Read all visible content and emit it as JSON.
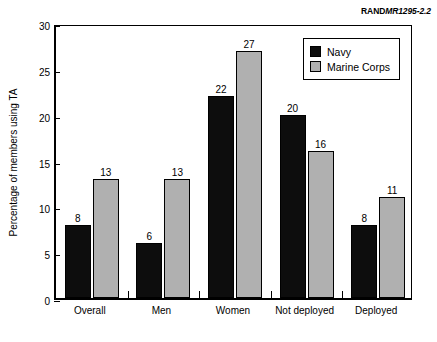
{
  "header": {
    "publisher": "RAND",
    "report_id": "MR1295-2.2"
  },
  "chart_data": {
    "type": "bar",
    "title": "",
    "xlabel": "",
    "ylabel": "Percentage of members using TA",
    "ylim": [
      0,
      30
    ],
    "yticks": [
      0,
      5,
      10,
      15,
      20,
      25,
      30
    ],
    "grid": false,
    "legend_position": "top-right-inside",
    "categories": [
      "Overall",
      "Men",
      "Women",
      "Not deployed",
      "Deployed"
    ],
    "series": [
      {
        "name": "Navy",
        "color": "#0d0d0d",
        "values": [
          8,
          6,
          22,
          20,
          8
        ]
      },
      {
        "name": "Marine Corps",
        "color": "#b0b0b0",
        "values": [
          13,
          13,
          27,
          16,
          11
        ]
      }
    ],
    "value_labels": {
      "Navy": [
        "8",
        "6",
        "22",
        "20",
        "8"
      ],
      "Marine Corps": [
        "13",
        "13",
        "27",
        "16",
        "11"
      ]
    },
    "ytick_labels": [
      "0",
      "5",
      "10",
      "15",
      "20",
      "25",
      "30"
    ]
  }
}
